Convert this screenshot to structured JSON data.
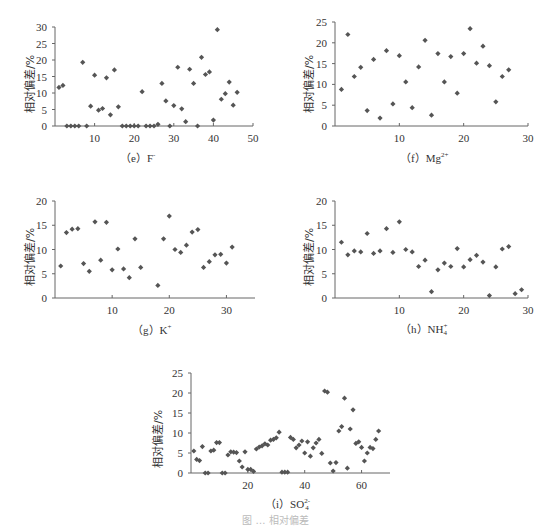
{
  "chart_data": [
    {
      "id": "e",
      "type": "scatter",
      "caption": "（e）F⁻",
      "caption_label": "（e）F",
      "caption_sup": "-",
      "xlabel": "",
      "ylabel": "相对偏差/%",
      "xlim": [
        0,
        50
      ],
      "ylim": [
        0,
        30
      ],
      "xticks": [
        10,
        20,
        30,
        40,
        50
      ],
      "yticks": [
        0,
        5,
        10,
        15,
        20,
        25,
        30
      ],
      "grid": false,
      "marker_color": "#555555",
      "points": [
        [
          1,
          11.7
        ],
        [
          2,
          12.3
        ],
        [
          3,
          0
        ],
        [
          4,
          0
        ],
        [
          5,
          0
        ],
        [
          6,
          0
        ],
        [
          7,
          19.3
        ],
        [
          8,
          0
        ],
        [
          9,
          6
        ],
        [
          10,
          15.4
        ],
        [
          11,
          4.8
        ],
        [
          12,
          5.3
        ],
        [
          13,
          14.6
        ],
        [
          14,
          3.4
        ],
        [
          15,
          17
        ],
        [
          16,
          5.8
        ],
        [
          17,
          0
        ],
        [
          18,
          0
        ],
        [
          19,
          0
        ],
        [
          20,
          0
        ],
        [
          21,
          0
        ],
        [
          22,
          10.4
        ],
        [
          23,
          0
        ],
        [
          24,
          0
        ],
        [
          25,
          0
        ],
        [
          26,
          0.5
        ],
        [
          27,
          12.9
        ],
        [
          28,
          7.6
        ],
        [
          29,
          0
        ],
        [
          30,
          6.2
        ],
        [
          31,
          17.8
        ],
        [
          32,
          5.2
        ],
        [
          33,
          1.3
        ],
        [
          34,
          17.2
        ],
        [
          35,
          12.9
        ],
        [
          36,
          0
        ],
        [
          37,
          20.8
        ],
        [
          38,
          15.6
        ],
        [
          39,
          16.4
        ],
        [
          40,
          1.8
        ],
        [
          41,
          29.2
        ],
        [
          42,
          8.1
        ],
        [
          43,
          9.8
        ],
        [
          44,
          13.3
        ],
        [
          45,
          6.3
        ],
        [
          46,
          10.2
        ]
      ]
    },
    {
      "id": "f",
      "type": "scatter",
      "caption": "（f）Mg²⁺",
      "caption_label": "（f）Mg",
      "caption_sup": "2+",
      "xlabel": "",
      "ylabel": "相对偏差/%",
      "xlim": [
        0,
        30
      ],
      "ylim": [
        0,
        25
      ],
      "xticks": [
        10,
        20,
        30
      ],
      "yticks": [
        0,
        5,
        10,
        15,
        20,
        25
      ],
      "grid": false,
      "marker_color": "#555555",
      "points": [
        [
          1,
          8.8
        ],
        [
          2,
          22
        ],
        [
          3,
          11.9
        ],
        [
          4,
          14.1
        ],
        [
          5,
          3.7
        ],
        [
          6,
          16
        ],
        [
          7,
          1.9
        ],
        [
          8,
          18.1
        ],
        [
          9,
          5.3
        ],
        [
          10,
          16.9
        ],
        [
          11,
          10.6
        ],
        [
          12,
          4.4
        ],
        [
          13,
          14.2
        ],
        [
          14,
          20.6
        ],
        [
          15,
          2.6
        ],
        [
          16,
          17.4
        ],
        [
          17,
          10.6
        ],
        [
          18,
          16.7
        ],
        [
          19,
          7.9
        ],
        [
          20,
          17.4
        ],
        [
          21,
          23.4
        ],
        [
          22,
          15.1
        ],
        [
          23,
          19.2
        ],
        [
          24,
          14.5
        ],
        [
          25,
          5.8
        ],
        [
          26,
          11.9
        ],
        [
          27,
          13.5
        ]
      ]
    },
    {
      "id": "g",
      "type": "scatter",
      "caption": "（g）K⁺",
      "caption_label": "（g）K",
      "caption_sup": "+",
      "xlabel": "",
      "ylabel": "相对偏差/%",
      "xlim": [
        0,
        35
      ],
      "ylim": [
        0,
        20
      ],
      "xticks": [
        10,
        20,
        30
      ],
      "yticks": [
        0,
        5,
        10,
        15,
        20
      ],
      "grid": false,
      "marker_color": "#555555",
      "points": [
        [
          1,
          6.6
        ],
        [
          2,
          13.5
        ],
        [
          3,
          14.2
        ],
        [
          4,
          14.3
        ],
        [
          5,
          7.1
        ],
        [
          6,
          5.5
        ],
        [
          7,
          15.7
        ],
        [
          8,
          7.8
        ],
        [
          9,
          15.6
        ],
        [
          10,
          5.8
        ],
        [
          11,
          10.1
        ],
        [
          12,
          6
        ],
        [
          13,
          4.2
        ],
        [
          14,
          12.2
        ],
        [
          15,
          6.3
        ],
        [
          18,
          2.6
        ],
        [
          19,
          12.2
        ],
        [
          20,
          16.9
        ],
        [
          21,
          10
        ],
        [
          22,
          9.4
        ],
        [
          23,
          10.9
        ],
        [
          24,
          13.6
        ],
        [
          25,
          14.1
        ],
        [
          26,
          6.3
        ],
        [
          27,
          7.5
        ],
        [
          28,
          8.9
        ],
        [
          29,
          9
        ],
        [
          30,
          7.2
        ],
        [
          31,
          10.5
        ]
      ]
    },
    {
      "id": "h",
      "type": "scatter",
      "caption": "（h）NH₄⁺",
      "caption_label": "（h）NH",
      "caption_sub": "4",
      "caption_sup": "+",
      "xlabel": "",
      "ylabel": "相对偏差/%",
      "xlim": [
        0,
        30
      ],
      "ylim": [
        0,
        20
      ],
      "xticks": [
        10,
        20,
        30
      ],
      "yticks": [
        0,
        5,
        10,
        15,
        20
      ],
      "grid": false,
      "marker_color": "#555555",
      "points": [
        [
          1,
          11.5
        ],
        [
          2,
          8.9
        ],
        [
          3,
          9.7
        ],
        [
          4,
          9.5
        ],
        [
          5,
          13.3
        ],
        [
          6,
          9.2
        ],
        [
          7,
          9.7
        ],
        [
          8,
          14.3
        ],
        [
          9,
          9.4
        ],
        [
          10,
          15.7
        ],
        [
          11,
          10
        ],
        [
          12,
          9.5
        ],
        [
          13,
          6.5
        ],
        [
          14,
          7.8
        ],
        [
          15,
          1.3
        ],
        [
          16,
          5.8
        ],
        [
          17,
          7.2
        ],
        [
          18,
          6.5
        ],
        [
          19,
          10.2
        ],
        [
          20,
          6.4
        ],
        [
          21,
          7.9
        ],
        [
          22,
          8.8
        ],
        [
          23,
          7.4
        ],
        [
          24,
          0.5
        ],
        [
          25,
          6.4
        ],
        [
          26,
          10.1
        ],
        [
          27,
          10.6
        ],
        [
          28,
          0.9
        ],
        [
          29,
          1.7
        ]
      ]
    },
    {
      "id": "i",
      "type": "scatter",
      "caption": "（i）SO₄²⁻",
      "caption_label": "（i）SO",
      "caption_sub": "4",
      "caption_sup": "2-",
      "xlabel": "",
      "ylabel": "相对偏差/%",
      "xlim": [
        0,
        70
      ],
      "ylim": [
        0,
        25
      ],
      "xticks": [
        20,
        40,
        60
      ],
      "yticks": [
        0,
        5,
        10,
        15,
        20,
        25
      ],
      "grid": false,
      "marker_color": "#555555",
      "points": [
        [
          1,
          5.5
        ],
        [
          2,
          3.4
        ],
        [
          3,
          3.1
        ],
        [
          4,
          6.6
        ],
        [
          5,
          0
        ],
        [
          6,
          0
        ],
        [
          7,
          5.5
        ],
        [
          8,
          5.7
        ],
        [
          9,
          7.6
        ],
        [
          10,
          7.6
        ],
        [
          11,
          0
        ],
        [
          12,
          0
        ],
        [
          13,
          4.5
        ],
        [
          14,
          5.3
        ],
        [
          15,
          5.2
        ],
        [
          16,
          5.1
        ],
        [
          17,
          3
        ],
        [
          18,
          1.5
        ],
        [
          19,
          5.3
        ],
        [
          20,
          0.9
        ],
        [
          21,
          0.9
        ],
        [
          22,
          0.4
        ],
        [
          23,
          6
        ],
        [
          24,
          6.5
        ],
        [
          25,
          6.8
        ],
        [
          26,
          7.3
        ],
        [
          27,
          7
        ],
        [
          28,
          8.2
        ],
        [
          29,
          8.4
        ],
        [
          30,
          8.8
        ],
        [
          31,
          10.2
        ],
        [
          32,
          0.2
        ],
        [
          33,
          0.2
        ],
        [
          34,
          0.2
        ],
        [
          35,
          8.9
        ],
        [
          36,
          8.4
        ],
        [
          37,
          6.3
        ],
        [
          38,
          7
        ],
        [
          39,
          8
        ],
        [
          40,
          5
        ],
        [
          41,
          7.8
        ],
        [
          42,
          4.2
        ],
        [
          43,
          6.3
        ],
        [
          44,
          7.5
        ],
        [
          45,
          8.4
        ],
        [
          46,
          4.9
        ],
        [
          47,
          20.5
        ],
        [
          48,
          20.2
        ],
        [
          49,
          2.5
        ],
        [
          50,
          0.5
        ],
        [
          51,
          2.6
        ],
        [
          52,
          10.5
        ],
        [
          53,
          11.6
        ],
        [
          54,
          18.7
        ],
        [
          55,
          1.2
        ],
        [
          56,
          11
        ],
        [
          57,
          15.8
        ],
        [
          58,
          7.4
        ],
        [
          59,
          7.8
        ],
        [
          60,
          6.4
        ],
        [
          61,
          3
        ],
        [
          62,
          5
        ],
        [
          63,
          6.4
        ],
        [
          64,
          6.1
        ],
        [
          65,
          8.4
        ],
        [
          66,
          10.5
        ]
      ]
    }
  ],
  "figure_caption": "图 … 相对偏差"
}
